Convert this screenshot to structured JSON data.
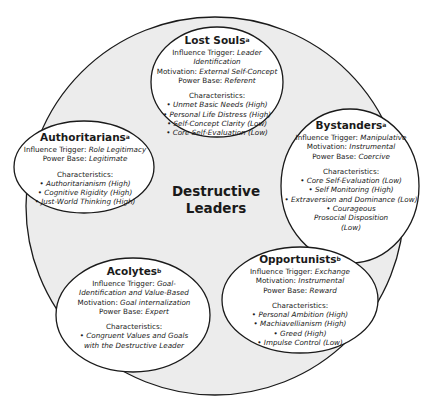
{
  "diagram": {
    "center_label_line1": "Destructive",
    "center_label_line2": "Leaders",
    "colors": {
      "circle_fill": "#ececec",
      "ellipse_fill": "#ffffff",
      "stroke": "#1a1a1a"
    },
    "nodes": [
      {
        "id": "lost-souls",
        "title": "Lost Souls",
        "superscript": "a",
        "influence_label": "Influence Trigger: ",
        "influence_value": "Leader Identification",
        "motivation_label": "Motivation: ",
        "motivation_value": "External Self-Concept",
        "power_label": "Power Base: ",
        "power_value": "Referent",
        "characteristics_label": "Characteristics:",
        "characteristics": [
          "Unmet Basic Needs (High)",
          "Personal Life Distress (High)",
          "Self-Concept Clarity (Low)",
          "Core Self-Evaluation (Low)"
        ]
      },
      {
        "id": "authoritarians",
        "title": "Authoritarians",
        "superscript": "a",
        "influence_label": "Influence Trigger: ",
        "influence_value": "Role Legitimacy",
        "power_label": "Power Base: ",
        "power_value": "Legitimate",
        "characteristics_label": "Characteristics:",
        "characteristics": [
          "Authoritarianism (High)",
          "Cognitive Rigidity (High)",
          "Just-World Thinking (High)"
        ]
      },
      {
        "id": "bystanders",
        "title": "Bystanders",
        "superscript": "a",
        "influence_label": "Influence Trigger: ",
        "influence_value": "Manipulative",
        "motivation_label": "Motivation: ",
        "motivation_value": "Instrumental",
        "power_label": "Power Base: ",
        "power_value": "Coercive",
        "characteristics_label": "Characteristics:",
        "characteristics": [
          "Core Self-Evaluation (Low)",
          "Self Monitoring (High)",
          "Extraversion and Dominance (Low)",
          "Courageous Prosocial Disposition (Low)"
        ]
      },
      {
        "id": "acolytes",
        "title": "Acolytes",
        "superscript": "b",
        "influence_label": "Influence Trigger: ",
        "influence_value": "Goal-Identification and Value-Based",
        "motivation_label": "Motivation: ",
        "motivation_value": "Goal internalization",
        "power_label": "Power Base: ",
        "power_value": "Expert",
        "characteristics_label": "Characteristics:",
        "characteristics": [
          "Congruent Values and Goals with the Destructive Leader"
        ]
      },
      {
        "id": "opportunists",
        "title": "Opportunists",
        "superscript": "b",
        "influence_label": "Influence Trigger: ",
        "influence_value": "Exchange",
        "motivation_label": "Motivation: ",
        "motivation_value": "Instrumental",
        "power_label": "Power Base: ",
        "power_value": "Reward",
        "characteristics_label": "Characteristics:",
        "characteristics": [
          "Personal Ambition (High)",
          "Machiavellianism (High)",
          "Greed (High)",
          "Impulse Control (Low)"
        ]
      }
    ]
  }
}
